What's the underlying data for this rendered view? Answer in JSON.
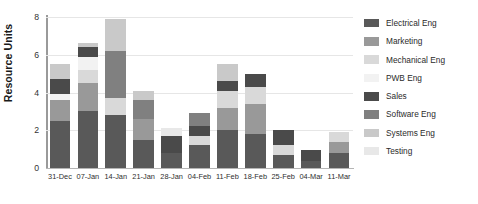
{
  "chart_data": {
    "type": "bar",
    "stacked": true,
    "title": "",
    "xlabel": "",
    "ylabel": "Resource Units",
    "ylim": [
      0,
      8
    ],
    "yticks": [
      0,
      2,
      4,
      6,
      8
    ],
    "grid": true,
    "legend_position": "right",
    "categories": [
      "31-Dec",
      "07-Jan",
      "14-Jan",
      "21-Jan",
      "28-Jan",
      "04-Feb",
      "11-Feb",
      "18-Feb",
      "25-Feb",
      "04-Mar",
      "11-Mar"
    ],
    "series": [
      {
        "name": "Electrical Eng",
        "color": "#595959",
        "values": [
          2.5,
          3.0,
          2.8,
          1.5,
          0.8,
          1.2,
          2.0,
          1.8,
          0.7,
          0.35,
          0.8
        ]
      },
      {
        "name": "Marketing",
        "color": "#999999",
        "values": [
          1.1,
          1.5,
          0.0,
          1.1,
          0.0,
          0.0,
          1.2,
          1.6,
          0.0,
          0.0,
          0.6
        ]
      },
      {
        "name": "Mechanical Eng",
        "color": "#d9d9d9",
        "values": [
          0.0,
          0.7,
          0.9,
          0.0,
          0.0,
          0.5,
          0.9,
          0.9,
          0.5,
          0.0,
          0.5
        ]
      },
      {
        "name": "PWB Eng",
        "color": "#f2f2f2",
        "values": [
          0.3,
          0.7,
          0.0,
          0.0,
          0.0,
          0.0,
          0.0,
          0.0,
          0.0,
          0.0,
          0.0
        ]
      },
      {
        "name": "Sales",
        "color": "#4a4a4a",
        "values": [
          0.8,
          0.5,
          0.0,
          0.0,
          0.9,
          0.5,
          0.5,
          0.7,
          0.8,
          0.6,
          0.0
        ]
      },
      {
        "name": "Software Eng",
        "color": "#808080",
        "values": [
          0.0,
          0.0,
          2.5,
          1.0,
          0.0,
          0.7,
          0.0,
          0.0,
          0.0,
          0.0,
          0.0
        ]
      },
      {
        "name": "Systems Eng",
        "color": "#c9c9c9",
        "values": [
          0.8,
          0.2,
          1.7,
          0.5,
          0.0,
          0.0,
          0.9,
          0.0,
          0.0,
          0.0,
          0.0
        ]
      },
      {
        "name": "Testing",
        "color": "#e8e8e8",
        "values": [
          0.0,
          0.0,
          0.0,
          0.0,
          0.4,
          0.0,
          0.0,
          0.0,
          0.0,
          0.0,
          0.0
        ]
      }
    ],
    "totals": [
      5.5,
      6.6,
      7.9,
      4.1,
      2.1,
      2.9,
      5.5,
      5.0,
      2.0,
      0.95,
      1.9
    ]
  },
  "legend": {
    "items": [
      {
        "label": "Electrical Eng",
        "color": "#595959"
      },
      {
        "label": "Marketing",
        "color": "#999999"
      },
      {
        "label": "Mechanical Eng",
        "color": "#d9d9d9"
      },
      {
        "label": "PWB Eng",
        "color": "#f2f2f2"
      },
      {
        "label": "Sales",
        "color": "#4a4a4a"
      },
      {
        "label": "Software Eng",
        "color": "#808080"
      },
      {
        "label": "Systems Eng",
        "color": "#c9c9c9"
      },
      {
        "label": "Testing",
        "color": "#e8e8e8"
      }
    ]
  }
}
